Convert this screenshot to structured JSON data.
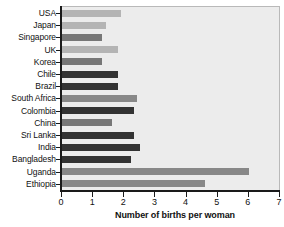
{
  "chart_data": {
    "type": "bar",
    "orientation": "horizontal",
    "title": "",
    "xlabel": "Number of births per woman",
    "ylabel": "",
    "xlim": [
      0,
      7
    ],
    "xticks": [
      "0",
      "1",
      "2",
      "3",
      "4",
      "5",
      "6",
      "7"
    ],
    "grid": false,
    "legend": "none",
    "categories": [
      "USA",
      "Japan",
      "Singapore",
      "UK",
      "Korea",
      "Chile",
      "Brazil",
      "South Africa",
      "Colombia",
      "China",
      "Sri Lanka",
      "India",
      "Bangladesh",
      "Uganda",
      "Ethiopia"
    ],
    "values": [
      1.9,
      1.4,
      1.3,
      1.8,
      1.3,
      1.8,
      1.8,
      2.4,
      2.3,
      1.6,
      2.3,
      2.5,
      2.2,
      6.0,
      4.6
    ],
    "bar_colors": [
      "#b4b4b4",
      "#b4b4b4",
      "#777777",
      "#b4b4b4",
      "#777777",
      "#333333",
      "#333333",
      "#888888",
      "#333333",
      "#777777",
      "#333333",
      "#333333",
      "#333333",
      "#888888",
      "#888888"
    ]
  },
  "axis": {
    "plot_background": "#ececec",
    "axis_color": "#1a1a1a"
  }
}
